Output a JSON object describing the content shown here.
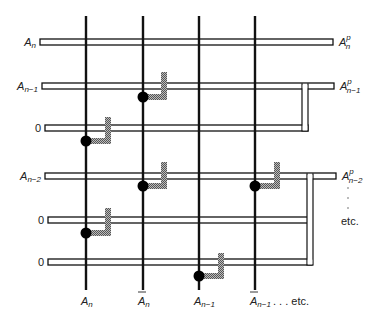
{
  "diagram": {
    "type": "logic-array-schematic",
    "colors": {
      "line": "#111111",
      "rail_fill": "#ffffff",
      "hatch": "#888888",
      "dot": "#000000"
    },
    "columns": [
      {
        "x": 86,
        "label_main": "A",
        "label_sub": "n",
        "overbar": false
      },
      {
        "x": 143,
        "label_main": "A",
        "label_sub": "n",
        "overbar": true
      },
      {
        "x": 199,
        "label_main": "A",
        "label_sub": "n−1",
        "overbar": false
      },
      {
        "x": 255,
        "label_main": "A",
        "label_sub": "n−1",
        "overbar": true
      }
    ],
    "column_trailer": ". . . etc.",
    "rows": [
      {
        "y": 42,
        "left_label_main": "A",
        "left_label_sub": "n",
        "x1": 40,
        "x2": 333,
        "right_label_main": "A",
        "right_label_sup": "p",
        "right_label_sub": "n"
      },
      {
        "y": 86,
        "left_label_main": "A",
        "left_label_sub": "n−1",
        "x1": 42,
        "x2": 334,
        "right_label_main": "A",
        "right_label_sup": "p",
        "right_label_sub": "n−1"
      },
      {
        "y": 128,
        "left_label_main": "0",
        "left_label_sub": "",
        "x1": 45,
        "x2": 308,
        "right_label_main": "",
        "right_label_sup": "",
        "right_label_sub": ""
      },
      {
        "y": 176,
        "left_label_main": "A",
        "left_label_sub": "n−2",
        "x1": 45,
        "x2": 336,
        "right_label_main": "A",
        "right_label_sup": "p",
        "right_label_sub": "n−2"
      },
      {
        "y": 220,
        "left_label_main": "0",
        "left_label_sub": "",
        "x1": 48,
        "x2": 312,
        "right_label_main": "",
        "right_label_sup": "",
        "right_label_sub": ""
      },
      {
        "y": 262,
        "left_label_main": "0",
        "left_label_sub": "",
        "x1": 48,
        "x2": 312,
        "right_label_main": "",
        "right_label_sup": "",
        "right_label_sub": ""
      }
    ],
    "right_trailer": "etc.",
    "connections": [
      {
        "col_x": 143,
        "dot_y": 97,
        "hatch_top": 72,
        "hatch_x": 164
      },
      {
        "col_x": 86,
        "dot_y": 141,
        "hatch_top": 117,
        "hatch_x": 108
      },
      {
        "col_x": 143,
        "dot_y": 186,
        "hatch_top": 162,
        "hatch_x": 164
      },
      {
        "col_x": 255,
        "dot_y": 186,
        "hatch_top": 162,
        "hatch_x": 277
      },
      {
        "col_x": 86,
        "dot_y": 233,
        "hatch_top": 208,
        "hatch_x": 108
      },
      {
        "col_x": 199,
        "dot_y": 276,
        "hatch_top": 253,
        "hatch_x": 221
      }
    ],
    "right_links": [
      {
        "x": 305,
        "y1": 86,
        "y2": 128
      },
      {
        "x": 310,
        "y1": 176,
        "y2": 262
      }
    ]
  }
}
